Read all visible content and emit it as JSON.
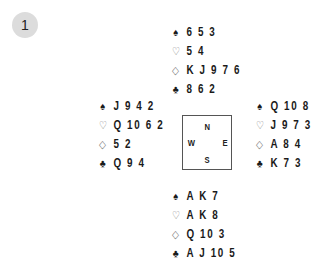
{
  "board": {
    "number": "1"
  },
  "suits": {
    "spades": "♠",
    "hearts": "♡",
    "diamonds": "◇",
    "clubs": "♣"
  },
  "hands": {
    "north": {
      "spades": "6 5 3",
      "hearts": "5 4",
      "diamonds": "K J 9 7 6",
      "clubs": "8 6 2"
    },
    "west": {
      "spades": "J 9 4 2",
      "hearts": "Q 10 6 2",
      "diamonds": "5 2",
      "clubs": "Q 9 4"
    },
    "east": {
      "spades": "Q 10 8",
      "hearts": "J 9 7 3",
      "diamonds": "A 8 4",
      "clubs": "K 7 3"
    },
    "south": {
      "spades": "A K 7",
      "hearts": "A K 8",
      "diamonds": "Q 10 3",
      "clubs": "A J 10 5"
    }
  },
  "compass": {
    "north": "N",
    "west": "W",
    "east": "E",
    "south": "S"
  }
}
